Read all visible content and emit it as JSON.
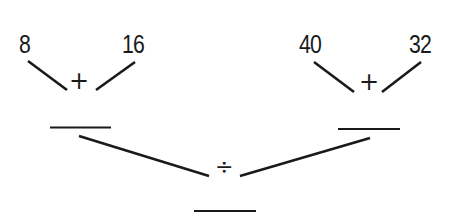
{
  "diagram": {
    "left": {
      "a": "8",
      "b": "16",
      "operator": "+",
      "answer": ""
    },
    "right": {
      "a": "40",
      "b": "32",
      "operator": "+",
      "answer": ""
    },
    "final": {
      "operator": "÷",
      "answer": ""
    }
  },
  "colors": {
    "ink": "#1a1a1a",
    "background": "#ffffff"
  }
}
